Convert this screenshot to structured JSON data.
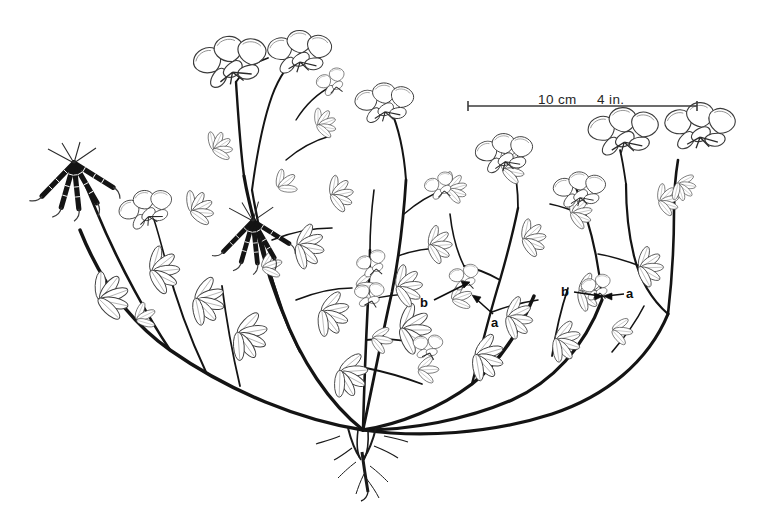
{
  "figure": {
    "kind": "botanical-line-illustration",
    "background_color": "#ffffff",
    "ink_color": "#111111",
    "outline_color": "#3a3a3a",
    "width": 769,
    "height": 522
  },
  "scale_bar": {
    "metric_label": "10 cm",
    "imperial_label": "4 in.",
    "left_x": 468,
    "right_x": 697,
    "y": 106,
    "tick_height": 9,
    "line_color": "#3b3b3b",
    "metric_label_x": 538,
    "imperial_label_x": 597,
    "label_y": 93
  },
  "callouts": [
    {
      "id": "b-left",
      "label": "b",
      "x": 420,
      "y": 296,
      "arrow_to_x": 466,
      "arrow_to_y": 281
    },
    {
      "id": "a-left",
      "label": "a",
      "x": 491,
      "y": 316,
      "arrow_to_x": 470,
      "arrow_to_y": 296
    },
    {
      "id": "b-right",
      "label": "b",
      "x": 561,
      "y": 285,
      "arrow_to_x": 600,
      "arrow_to_y": 295
    },
    {
      "id": "a-right",
      "label": "a",
      "x": 626,
      "y": 287,
      "arrow_to_x": 602,
      "arrow_to_y": 295
    }
  ],
  "structures": {
    "crown_x": 363,
    "crown_y": 430,
    "root_tip_x": 366,
    "root_tip_y": 492,
    "pod_clusters": [
      {
        "id": "pod-cluster-left",
        "hub_x": 74,
        "hub_y": 163
      },
      {
        "id": "pod-cluster-middle",
        "hub_x": 253,
        "hub_y": 221
      }
    ],
    "flower_heads": [
      {
        "id": "flower-head-upper-left",
        "x": 232,
        "y": 70
      },
      {
        "id": "flower-head-upper-mid",
        "x": 300,
        "y": 60
      },
      {
        "id": "flower-head-mid-left",
        "x": 148,
        "y": 215
      },
      {
        "id": "flower-head-center",
        "x": 376,
        "y": 268
      },
      {
        "id": "flower-head-center-upper",
        "x": 385,
        "y": 110
      },
      {
        "id": "flower-head-right-mid",
        "x": 505,
        "y": 160
      },
      {
        "id": "flower-head-right-a",
        "x": 580,
        "y": 196
      },
      {
        "id": "flower-head-far-right-1",
        "x": 624,
        "y": 140
      },
      {
        "id": "flower-head-far-right-2",
        "x": 700,
        "y": 135
      }
    ]
  }
}
